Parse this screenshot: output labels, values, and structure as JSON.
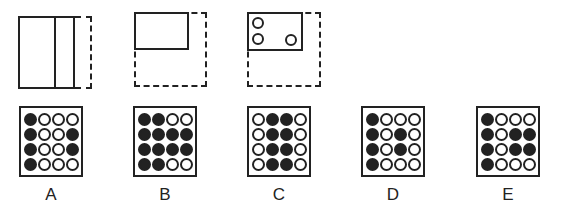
{
  "sequence": [
    {
      "id": "fig1",
      "description": "tall rectangle with vertical divider, dashed right strip"
    },
    {
      "id": "fig2",
      "description": "small rectangle top-left, dashed L-shape continuation to bottom-right"
    },
    {
      "id": "fig3",
      "description": "rectangle with three circles, dashed L-shape continuation"
    }
  ],
  "options": [
    {
      "label": "A",
      "grid": [
        [
          1,
          0,
          0,
          0
        ],
        [
          1,
          0,
          0,
          1
        ],
        [
          1,
          0,
          0,
          1
        ],
        [
          1,
          0,
          0,
          0
        ]
      ]
    },
    {
      "label": "B",
      "grid": [
        [
          1,
          1,
          0,
          0
        ],
        [
          1,
          1,
          1,
          1
        ],
        [
          1,
          1,
          1,
          1
        ],
        [
          1,
          1,
          0,
          0
        ]
      ]
    },
    {
      "label": "C",
      "grid": [
        [
          0,
          1,
          1,
          0
        ],
        [
          0,
          1,
          1,
          0
        ],
        [
          0,
          1,
          1,
          0
        ],
        [
          0,
          1,
          1,
          0
        ]
      ]
    },
    {
      "label": "D",
      "grid": [
        [
          1,
          0,
          0,
          0
        ],
        [
          1,
          0,
          1,
          0
        ],
        [
          1,
          0,
          1,
          0
        ],
        [
          1,
          0,
          0,
          0
        ]
      ]
    },
    {
      "label": "E",
      "grid": [
        [
          1,
          0,
          0,
          0
        ],
        [
          1,
          0,
          1,
          1
        ],
        [
          1,
          0,
          1,
          1
        ],
        [
          1,
          0,
          0,
          0
        ]
      ]
    }
  ]
}
